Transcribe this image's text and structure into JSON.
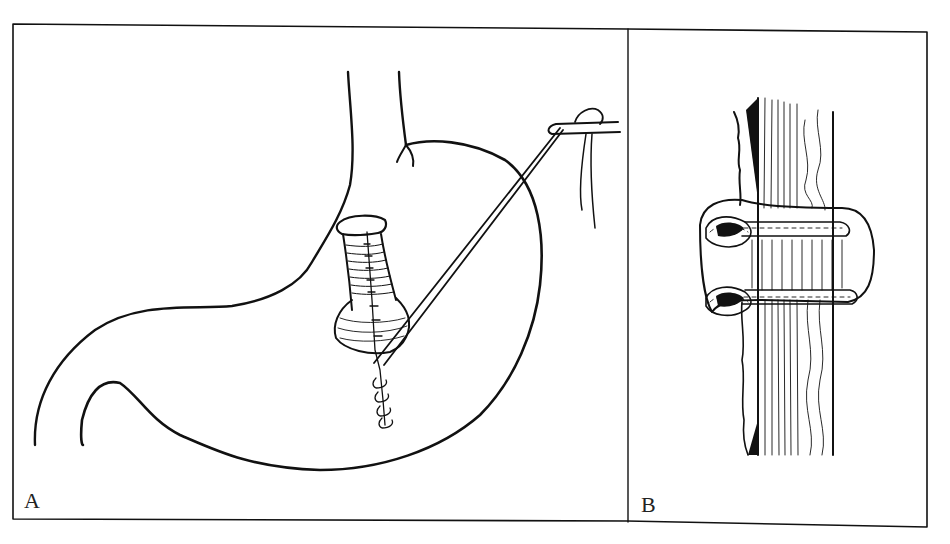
{
  "figure": {
    "panels": [
      {
        "id": "A",
        "label": "A",
        "subject": "stomach-with-tubular-structure-and-suture-traction"
      },
      {
        "id": "B",
        "label": "B",
        "subject": "wrapped-tubular-structure-cross-section"
      }
    ],
    "colors": {
      "ink": "#111111",
      "background": "#ffffff",
      "frame": "#333333"
    }
  }
}
